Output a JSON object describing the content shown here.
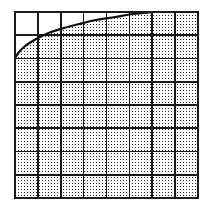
{
  "figure": {
    "kind": "math-diagram",
    "canvas": {
      "width": 212,
      "height": 206,
      "background": "#ffffff"
    },
    "plot_box": {
      "x_left": 15,
      "y_top": 12,
      "x_right": 198,
      "y_bottom": 198,
      "width": 183,
      "height": 186
    },
    "grid": {
      "columns": 8,
      "rows": 8,
      "cell_width": 22.875,
      "cell_height": 23.25,
      "line_color": "#1a1a1a",
      "inner_line_width": 1.6,
      "border_line_width": 2.6,
      "show_grid": true
    },
    "curve": {
      "label": "boundary curve",
      "color": "#111111",
      "line_width": 2.2,
      "shape": "concave-increasing",
      "description": "Rises steeply from the left edge then flattens, meeting the top edge near column 6",
      "entry_point": {
        "x": 15,
        "y": 58
      },
      "exit_point": {
        "x": 153,
        "y": 12
      },
      "points": [
        {
          "x": 15,
          "y": 58
        },
        {
          "x": 19,
          "y": 52
        },
        {
          "x": 24,
          "y": 47
        },
        {
          "x": 31,
          "y": 42
        },
        {
          "x": 40,
          "y": 37
        },
        {
          "x": 51,
          "y": 32
        },
        {
          "x": 64,
          "y": 28
        },
        {
          "x": 79,
          "y": 24
        },
        {
          "x": 96,
          "y": 20
        },
        {
          "x": 115,
          "y": 17
        },
        {
          "x": 133,
          "y": 14
        },
        {
          "x": 153,
          "y": 12
        }
      ]
    },
    "shaded_region": {
      "label": "region below the curve",
      "fill_style": "stipple-dots",
      "dot_color": "#2b2b2b",
      "dot_background": "#fbfbfb",
      "dot_spacing": 3,
      "dot_size": 1.4,
      "covers": "everything below and right of the curve inside the grid"
    },
    "unshaded_region": {
      "label": "region above the curve",
      "fill": "#ffffff",
      "covers": "top-left corner above the curve"
    }
  }
}
